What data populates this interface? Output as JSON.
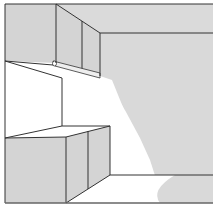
{
  "illustration": {
    "subject": "Kitchen cabinets with under-cabinet light fixture casting light onto wall and counter",
    "colors": {
      "background": "#ffffff",
      "surface_gray": "#d4d4d4",
      "wall_gray": "#d9d9d9",
      "line": "#333333",
      "light": "#ffffff"
    }
  }
}
